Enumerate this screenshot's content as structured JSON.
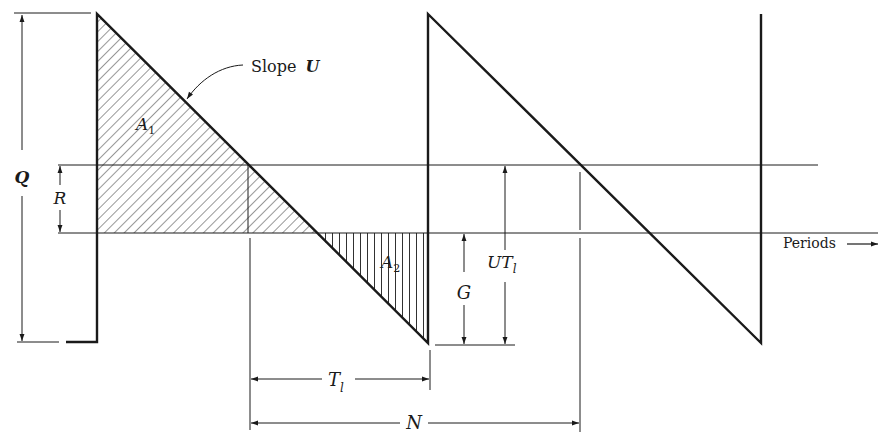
{
  "diagram": {
    "type": "inventory sawtooth diagram",
    "colors": {
      "ink": "#1a1a1a",
      "background": "#ffffff"
    },
    "labels": {
      "slope": "Slope",
      "slope_var": "U",
      "Q": "Q",
      "R": "R",
      "A1": "A",
      "A1_sub": "1",
      "A2": "A",
      "A2_sub": "2",
      "G": "G",
      "UTl": "UT",
      "UTl_sub": "l",
      "Tl": "T",
      "Tl_sub": "l",
      "N": "N",
      "periods": "Periods",
      "periods_arrow": "⟶"
    },
    "geometry": {
      "top_y": 14,
      "reorder_level_y": 165,
      "zero_level_y": 233,
      "bottom_y": 343,
      "cycle_starts_x": [
        97,
        428,
        761
      ],
      "reorder_points_x": [
        248,
        580
      ],
      "stockout_points_x": [
        316,
        648
      ]
    },
    "dimensions": [
      {
        "name": "Q",
        "from": "bottom",
        "to": "top"
      },
      {
        "name": "R",
        "from": "zero",
        "to": "reorder level"
      },
      {
        "name": "G",
        "from": "bottom",
        "to": "zero"
      },
      {
        "name": "UT_l",
        "from": "bottom",
        "to": "reorder level"
      },
      {
        "name": "T_l",
        "from": "reorder point",
        "to": "replenishment"
      },
      {
        "name": "N",
        "from": "reorder point",
        "to": "next reorder point"
      }
    ],
    "shaded_areas": [
      {
        "name": "A_1",
        "pattern": "diagonal hatch",
        "region": "inventory above zero in first cycle"
      },
      {
        "name": "A_2",
        "pattern": "vertical hatch",
        "region": "shortage below zero in first cycle"
      }
    ]
  }
}
